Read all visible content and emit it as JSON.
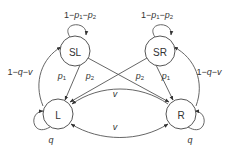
{
  "diagram": {
    "type": "state-transition",
    "nodes": [
      {
        "id": "SL",
        "label": "SL"
      },
      {
        "id": "SR",
        "label": "SR"
      },
      {
        "id": "L",
        "label": "L"
      },
      {
        "id": "R",
        "label": "R"
      }
    ],
    "edges": [
      {
        "from": "SL",
        "to": "SL",
        "label": "1−p₁−p₂"
      },
      {
        "from": "SR",
        "to": "SR",
        "label": "1−p₁−p₂"
      },
      {
        "from": "SL",
        "to": "L",
        "label": "p₁"
      },
      {
        "from": "SL",
        "to": "R",
        "label": "p₂"
      },
      {
        "from": "SR",
        "to": "L",
        "label": "p₂"
      },
      {
        "from": "SR",
        "to": "R",
        "label": "p₁"
      },
      {
        "from": "L",
        "to": "SL",
        "label": "1−q−v"
      },
      {
        "from": "R",
        "to": "SR",
        "label": "1−q−v"
      },
      {
        "from": "R",
        "to": "L",
        "label": "v"
      },
      {
        "from": "L",
        "to": "R",
        "label": "v"
      },
      {
        "from": "L",
        "to": "L",
        "label": "q"
      },
      {
        "from": "R",
        "to": "R",
        "label": "q"
      }
    ]
  },
  "labels": {
    "sl": "SL",
    "sr": "SR",
    "l": "L",
    "r": "R",
    "sl_self_1": "1−",
    "sl_self_p1": "p",
    "sl_self_sub1": "1",
    "sl_self_minus": "−",
    "sl_self_p2": "p",
    "sl_self_sub2": "2",
    "sr_self_1": "1−",
    "sr_self_p1": "p",
    "sr_self_sub1": "1",
    "sr_self_minus": "−",
    "sr_self_p2": "p",
    "sr_self_sub2": "2",
    "left_return_1": "1−",
    "left_return_q": "q",
    "left_return_minus": "−",
    "left_return_v": "v",
    "right_return_1": "1−",
    "right_return_q": "q",
    "right_return_minus": "−",
    "right_return_v": "v",
    "p": "p",
    "sub1": "1",
    "sub2": "2",
    "v_upper": "v",
    "v_lower": "v",
    "q_left": "q",
    "q_right": "q"
  },
  "colors": {
    "stroke": "#555555",
    "text": "#333333",
    "background": "#ffffff"
  }
}
